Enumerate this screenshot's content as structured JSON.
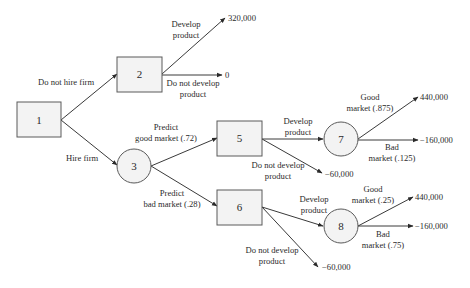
{
  "diagram": {
    "type": "decision-tree",
    "nodes": [
      {
        "id": "1",
        "shape": "decision",
        "label": "1"
      },
      {
        "id": "2",
        "shape": "decision",
        "label": "2"
      },
      {
        "id": "3",
        "shape": "chance",
        "label": "3"
      },
      {
        "id": "5",
        "shape": "decision",
        "label": "5"
      },
      {
        "id": "6",
        "shape": "decision",
        "label": "6"
      },
      {
        "id": "7",
        "shape": "chance",
        "label": "7"
      },
      {
        "id": "8",
        "shape": "chance",
        "label": "8"
      }
    ],
    "edges": [
      {
        "from": "1",
        "to": "2",
        "label_lines": [
          "Do not hire firm"
        ]
      },
      {
        "from": "1",
        "to": "3",
        "label_lines": [
          "Hire firm"
        ]
      },
      {
        "from": "2",
        "to": "payoff_a",
        "label_lines": [
          "Develop",
          "product"
        ]
      },
      {
        "from": "2",
        "to": "payoff_b",
        "label_lines": [
          "Do not develop",
          "product"
        ]
      },
      {
        "from": "3",
        "to": "5",
        "label_lines": [
          "Predict",
          "good market (.72)"
        ]
      },
      {
        "from": "3",
        "to": "6",
        "label_lines": [
          "Predict",
          "bad market (.28)"
        ]
      },
      {
        "from": "5",
        "to": "7",
        "label_lines": [
          "Develop",
          "product"
        ]
      },
      {
        "from": "5",
        "to": "payoff_c",
        "label_lines": [
          "Do not develop",
          "product"
        ]
      },
      {
        "from": "7",
        "to": "payoff_d",
        "label_lines": [
          "Good",
          "market (.875)"
        ]
      },
      {
        "from": "7",
        "to": "payoff_e",
        "label_lines": [
          "Bad",
          "market (.125)"
        ]
      },
      {
        "from": "6",
        "to": "8",
        "label_lines": [
          "Develop",
          "product"
        ]
      },
      {
        "from": "6",
        "to": "payoff_f",
        "label_lines": [
          "Do not develop",
          "product"
        ]
      },
      {
        "from": "8",
        "to": "payoff_g",
        "label_lines": [
          "Good",
          "market (.25)"
        ]
      },
      {
        "from": "8",
        "to": "payoff_h",
        "label_lines": [
          "Bad",
          "market (.75)"
        ]
      }
    ],
    "payoffs": {
      "payoff_a": "320,000",
      "payoff_b": "0",
      "payoff_c": "−60,000",
      "payoff_d": "440,000",
      "payoff_e": "−160,000",
      "payoff_f": "−60,000",
      "payoff_g": "440,000",
      "payoff_h": "−160,000"
    }
  },
  "colors": {
    "node_fill": "#f3f3f3",
    "node_stroke": "#5a5a5a",
    "edge": "#3a3a3a",
    "text": "#2a2a2a",
    "background": "#ffffff"
  }
}
